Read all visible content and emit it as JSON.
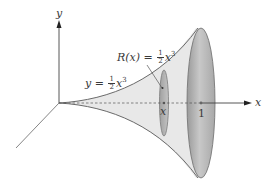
{
  "figure": {
    "type": "solid-of-revolution",
    "colors": {
      "axis": "#444444",
      "curve": "#707070",
      "solid_fill": "#e6e6e6",
      "disk_fill": "#b8b8b8",
      "disk_edge": "#7a7a7a"
    }
  },
  "axes": {
    "y_label": "y",
    "x_label": "x"
  },
  "curve_label": {
    "lhs": "y =",
    "frac_num": "1",
    "frac_den": "2",
    "var": "x",
    "exp": "3"
  },
  "radius_label": {
    "lhs": "R(x) =",
    "frac_num": "1",
    "frac_den": "2",
    "var": "x",
    "exp": "3"
  },
  "disk_x_label": "x",
  "end_label": "1"
}
